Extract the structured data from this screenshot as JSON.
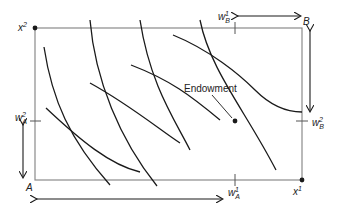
{
  "diagram": {
    "type": "edgeworth-box",
    "labels": {
      "origin_a": "A",
      "origin_b": "B",
      "x1_base": "x",
      "x1_sup": "1",
      "x2_base": "x",
      "x2_sup": "2",
      "wa1_base": "w",
      "wa1_sub": "A",
      "wa1_sup": "1",
      "wa2_base": "w",
      "wa2_sub": "A",
      "wa2_sup": "2",
      "wb1_base": "w",
      "wb1_sub": "B",
      "wb1_sup": "1",
      "wb2_base": "w",
      "wb2_sub": "B",
      "wb2_sup": "2",
      "endowment": "Endowment"
    },
    "colors": {
      "box": "#8a8a8a",
      "curves": "#1a1a1a",
      "arrows": "#1a1a1a",
      "background": "#ffffff"
    }
  }
}
